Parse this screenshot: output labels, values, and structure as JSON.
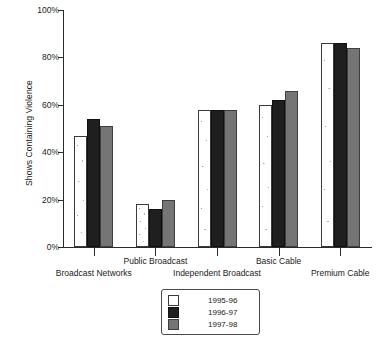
{
  "chart_data": {
    "type": "bar",
    "title": "",
    "xlabel": "",
    "ylabel": "Shows Containing Violence",
    "ylim": [
      0,
      100
    ],
    "yticks": [
      0,
      20,
      40,
      60,
      80,
      100
    ],
    "ytick_labels": [
      "0%",
      "20%",
      "40%",
      "60%",
      "80%",
      "100%"
    ],
    "grid": false,
    "legend_position": "bottom-center",
    "categories": [
      "Broadcast Networks",
      "Public Broadcast",
      "Independent Broadcast",
      "Basic Cable",
      "Premium Cable"
    ],
    "series": [
      {
        "name": "1995-96",
        "color": "#ffffff",
        "values": [
          47,
          18,
          58,
          60,
          86
        ]
      },
      {
        "name": "1996-97",
        "color": "#1f1f1f",
        "values": [
          54,
          16,
          58,
          62,
          86
        ]
      },
      {
        "name": "1997-98",
        "color": "#757575",
        "values": [
          51,
          20,
          58,
          66,
          84
        ]
      }
    ]
  },
  "axis": {
    "y_title": "Shows Containing Violence"
  },
  "legend": {
    "entries": [
      {
        "label": "1995-96"
      },
      {
        "label": "1996-97"
      },
      {
        "label": "1997-98"
      }
    ]
  }
}
